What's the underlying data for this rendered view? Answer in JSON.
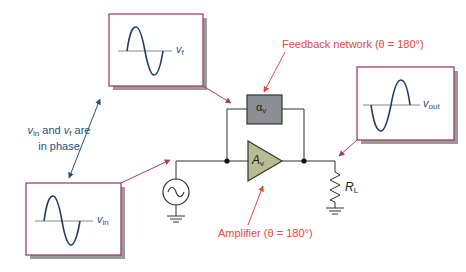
{
  "diagram": {
    "colors": {
      "wire": "#333333",
      "box_border": "#a3405e",
      "box_shadow": "#9a9a9a",
      "wave": "#1e3e5e",
      "axis": "#888888",
      "annotation_red": "#e2483b",
      "annotation_blue": "#27507a",
      "amplifier_fill": "#b9bb90",
      "feedback_fill": "#8b8f93"
    },
    "labels": {
      "feedback_network": "Feedback network (θ = 180°)",
      "amplifier": "Amplifier (θ = 180°)",
      "phase_note_line1_a": "v",
      "phase_note_line1_sub_a": "in",
      "phase_note_line1_mid": " and ",
      "phase_note_line1_b": "v",
      "phase_note_line1_sub_b": "f",
      "phase_note_line1_end": " are",
      "phase_note_line2": "in phase",
      "feedback_symbol": "α",
      "feedback_symbol_sub": "v",
      "amplifier_symbol": "A",
      "amplifier_symbol_sub": "v",
      "load_symbol": "R",
      "load_symbol_sub": "L"
    },
    "waveform_boxes": [
      {
        "id": "vf",
        "label": "v",
        "sub": "f",
        "phase": "in-phase"
      },
      {
        "id": "vout",
        "label": "v",
        "sub": "out",
        "phase": "inverted"
      },
      {
        "id": "vin",
        "label": "v",
        "sub": "in",
        "phase": "in-phase"
      }
    ]
  }
}
